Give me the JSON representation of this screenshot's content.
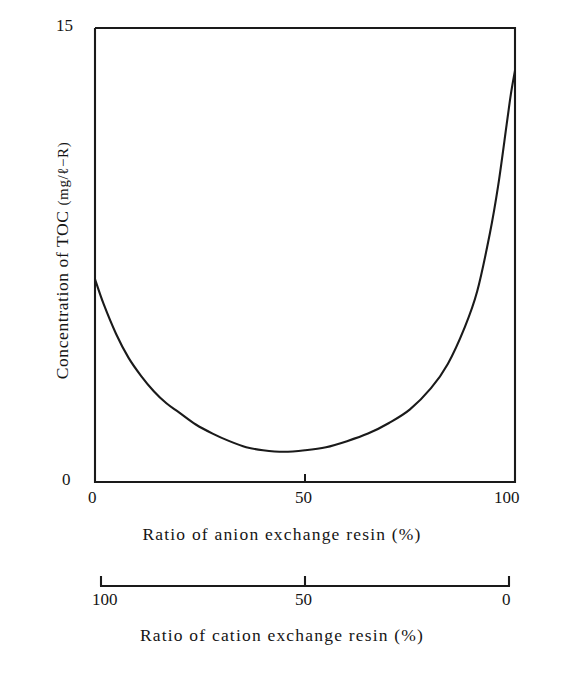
{
  "figure": {
    "background_color": "#ffffff",
    "line_color": "#1a1a1a"
  },
  "axes": {
    "y": {
      "label_prefix": "Concentration of TOC",
      "label_unit": "(mg/ℓ−R)",
      "label_full": "Concentration of TOC (mg/ℓ−R)",
      "ticks": [
        "0",
        "15"
      ],
      "tick_top": "15",
      "tick_bottom": "0",
      "range": [
        0,
        15
      ]
    },
    "x_primary": {
      "label": "Ratio of  anion exchange resin (%)",
      "ticks": [
        "0",
        "50",
        "100"
      ],
      "tick_left": "0",
      "tick_mid": "50",
      "tick_right": "100",
      "range": [
        0,
        100
      ]
    },
    "x_secondary": {
      "label": "Ratio of  cation exchange resin (%)",
      "ticks": [
        "100",
        "50",
        "0"
      ],
      "tick_left": "100",
      "tick_mid": "50",
      "tick_right": "0",
      "range": [
        100,
        0
      ]
    }
  },
  "chart_data": {
    "type": "line",
    "title": "",
    "xlabel": "Ratio of  anion exchange resin (%)",
    "ylabel": "Concentration of TOC (mg/ℓ−R)",
    "xlabel_secondary": "Ratio of  cation exchange resin (%)",
    "xlim": [
      0,
      100
    ],
    "ylim": [
      0,
      15
    ],
    "grid": false,
    "legend": false,
    "x_secondary_lim": [
      100,
      0
    ],
    "series": [
      {
        "name": "TOC concentration",
        "x": [
          0,
          2,
          5,
          8,
          11,
          14,
          17,
          20,
          24,
          28,
          32,
          36,
          40,
          45,
          50,
          55,
          60,
          65,
          70,
          75,
          80,
          84,
          88,
          91,
          94,
          96,
          98,
          99,
          100
        ],
        "values": [
          6.7,
          5.9,
          4.9,
          4.1,
          3.5,
          3.0,
          2.6,
          2.3,
          1.9,
          1.6,
          1.35,
          1.15,
          1.05,
          1.0,
          1.05,
          1.15,
          1.35,
          1.6,
          1.95,
          2.4,
          3.1,
          3.9,
          5.1,
          6.3,
          8.2,
          9.8,
          11.8,
          12.8,
          13.6
        ]
      }
    ],
    "annotations": [
      {
        "text": "minimum near 40% anion exchange resin",
        "x": 40,
        "y": 1.05
      }
    ]
  }
}
